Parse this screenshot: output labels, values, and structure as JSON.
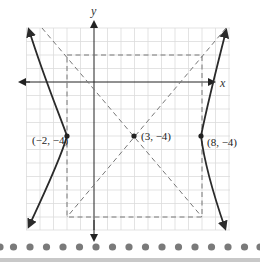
{
  "diagram": {
    "type": "hyperbola-graph",
    "axes": {
      "x_label": "x",
      "y_label": "y"
    },
    "center": {
      "label": "(3, −4)",
      "x": 3,
      "y": -4
    },
    "vertices": [
      {
        "label": "(−2, −4)",
        "x": -2,
        "y": -4
      },
      {
        "label": "(8, −4)",
        "x": 8,
        "y": -4
      }
    ],
    "reference_rectangle": {
      "x_min": -2,
      "x_max": 8,
      "y_min": -10,
      "y_max": 2,
      "style": "dashed"
    },
    "asymptotes": {
      "count": 2,
      "style": "dashed"
    },
    "colors": {
      "curve": "#2a2a2a",
      "grid": "#d9d9d9",
      "dashed": "#777777",
      "dots": "#7a7a7a",
      "bottom_bar": "#c8c8c8"
    }
  },
  "decor": {
    "dot_count": 16
  }
}
